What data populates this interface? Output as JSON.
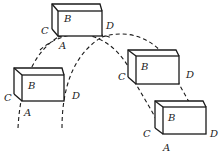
{
  "diagram": {
    "stroke_color": "#1a1a1a",
    "background": "#ffffff",
    "boxes": [
      {
        "id": "top",
        "labels": {
          "B": "B",
          "C": "C",
          "D": "D",
          "A": "A"
        }
      },
      {
        "id": "left",
        "labels": {
          "B": "B",
          "C": "C",
          "D": "D",
          "A": "A"
        }
      },
      {
        "id": "right-middle",
        "labels": {
          "B": "B",
          "C": "C",
          "D": "D"
        }
      },
      {
        "id": "bottom-right",
        "labels": {
          "B": "B",
          "C": "C",
          "D": "D",
          "A": "A"
        }
      }
    ],
    "trajectories": [
      {
        "name": "path of A",
        "style": "dashed"
      },
      {
        "name": "path of D",
        "style": "dashed"
      }
    ]
  }
}
